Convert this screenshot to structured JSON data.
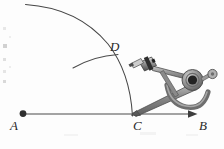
{
  "figure": {
    "kind": "geometric-construction",
    "background_color": "#fdfdfd",
    "ink_color": "#3a3a3a",
    "metal_color": "#8d8d8d",
    "metal_dark": "#555555",
    "metal_light": "#c9c9c9"
  },
  "labels": {
    "a": "A",
    "b": "B",
    "c": "C",
    "d": "D"
  },
  "points": {
    "a": {
      "x": 23,
      "y": 114,
      "label": "A",
      "marker": "filled-dot"
    },
    "b": {
      "x": 196,
      "y": 114,
      "label": "B",
      "marker": "arrowhead"
    },
    "c": {
      "x": 131,
      "y": 114,
      "label": "C",
      "marker": "none"
    },
    "d": {
      "x": 116,
      "y": 58,
      "label": "D",
      "marker": "none"
    }
  },
  "lines": {
    "ray_ab": {
      "from": "A",
      "to": "B",
      "arrow_at": "B"
    }
  },
  "arcs": {
    "big_arc_center_a": {
      "center": "A",
      "radius": 110,
      "from_deg": 250,
      "to_deg": 305
    },
    "small_arc_center_c": {
      "center": "C",
      "radius": 62,
      "from_deg": 190,
      "to_deg": 250
    }
  },
  "instrument": {
    "name": "drawing-compass",
    "parts": [
      "pencil-leg",
      "needle-leg",
      "pivot-hub",
      "thumb-knob",
      "quadrant-bracket",
      "pencil-clamp"
    ]
  }
}
